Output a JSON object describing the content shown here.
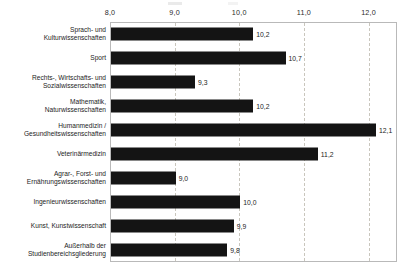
{
  "chart_data": {
    "type": "bar",
    "orientation": "horizontal",
    "title": "",
    "xlabel": "",
    "ylabel": "",
    "xlim": [
      8.0,
      12.44
    ],
    "baseline": 8.0,
    "grid": true,
    "grid_style": "dashed-vertical",
    "legend": "none",
    "decimal_separator": ",",
    "xticks": [
      "8,0",
      "9,0",
      "10,0",
      "11,0",
      "12,0"
    ],
    "xtick_values": [
      8.0,
      9.0,
      10.0,
      11.0,
      12.0
    ],
    "categories": [
      "Sprach- und\nKulturwissenschaften",
      "Sport",
      "Rechts-, Wirtschafts- und\nSozialwissenschaften",
      "Mathematik,\nNaturwissenschaften",
      "Humanmedizin /\nGesundheitswissenschaften",
      "Veterinärmedizin",
      "Agrar-, Forst- und\nErnährungswissenschaften",
      "Ingenieurwissenschaften",
      "Kunst, Kunstwissenschaft",
      "Außerhalb der\nStudienbereichsgliederung"
    ],
    "values": [
      10.2,
      10.7,
      9.3,
      10.2,
      12.1,
      11.2,
      9.0,
      10.0,
      9.9,
      9.8
    ],
    "value_labels": [
      "10,2",
      "10,7",
      "9,3",
      "10,2",
      "12,1",
      "11,2",
      "9,0",
      "10,0",
      "9,9",
      "9,8"
    ],
    "bar_color": "#141414",
    "grid_color": "#c9c6bd",
    "frame_color": "#b9b9b9"
  }
}
